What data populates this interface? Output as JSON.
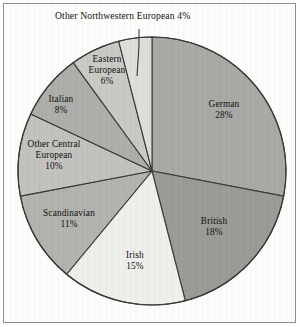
{
  "chart_data": {
    "type": "pie",
    "title": "",
    "categories": [
      "German",
      "British",
      "Irish",
      "Scandinavian",
      "Other Central European",
      "Italian",
      "Eastern European",
      "Other Northwestern European"
    ],
    "values": [
      28,
      18,
      15,
      11,
      10,
      8,
      6,
      4
    ],
    "value_labels": [
      "28%",
      "18%",
      "15%",
      "11%",
      "10%",
      "8%",
      "6%",
      "4%"
    ],
    "units": "percent",
    "legend": "none",
    "grid": false,
    "start_angle_deg": -90,
    "direction": "clockwise",
    "slice_colors": [
      "#a9a9a6",
      "#9b9b98",
      "#efefec",
      "#b3b3b0",
      "#c2c2bf",
      "#aeaeab",
      "#c9c9c6",
      "#dededb"
    ],
    "stroke_color": "#3b3a38",
    "annotations": [
      {
        "text": "Other Northwestern European 4%",
        "target_slice": "Other Northwestern European",
        "leader_line": true
      }
    ],
    "slices": [
      {
        "label": "German",
        "value": 28,
        "value_label": "28%",
        "color": "#a9a9a6"
      },
      {
        "label": "British",
        "value": 18,
        "value_label": "18%",
        "color": "#9b9b98"
      },
      {
        "label": "Irish",
        "value": 15,
        "value_label": "15%",
        "color": "#efefec"
      },
      {
        "label": "Scandinavian",
        "value": 11,
        "value_label": "11%",
        "color": "#b3b3b0"
      },
      {
        "label": "Other Central European",
        "value": 10,
        "value_label": "10%",
        "color": "#c2c2bf"
      },
      {
        "label": "Italian",
        "value": 8,
        "value_label": "8%",
        "color": "#aeaeab"
      },
      {
        "label": "Eastern European",
        "value": 6,
        "value_label": "6%",
        "color": "#c9c9c6"
      },
      {
        "label": "Other Northwestern European",
        "value": 4,
        "value_label": "4%",
        "color": "#dededb"
      }
    ]
  },
  "labels": {
    "callout": "Other Northwestern European 4%",
    "german_name": "German",
    "german_value": "28%",
    "british_name": "British",
    "british_value": "18%",
    "irish_name": "Irish",
    "irish_value": "15%",
    "scandinavian_name": "Scandinavian",
    "scandinavian_value": "11%",
    "other_central_name_line1": "Other Central",
    "other_central_name_line2": "European",
    "other_central_value": "10%",
    "italian_name": "Italian",
    "italian_value": "8%",
    "eastern_name_line1": "Eastern",
    "eastern_name_line2": "European",
    "eastern_value": "6%"
  }
}
